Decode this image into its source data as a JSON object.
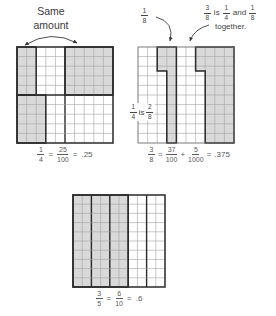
{
  "left_panel": {
    "annotation": {
      "line1": "Same",
      "line2": "amount"
    },
    "caption": {
      "frac1": {
        "num": "1",
        "den": "4"
      },
      "eq1": "=",
      "frac2": {
        "num": "25",
        "den": "100"
      },
      "eq2": "=",
      "decimal": ".25"
    }
  },
  "right_panel": {
    "one_eighth_label": {
      "num": "1",
      "den": "8"
    },
    "note": {
      "frac1": {
        "num": "3",
        "den": "8"
      },
      "word1": "is",
      "frac2": {
        "num": "1",
        "den": "4"
      },
      "word2": "and",
      "frac3": {
        "num": "1",
        "den": "8"
      },
      "line2": "together."
    },
    "inner_label": {
      "frac1": {
        "num": "1",
        "den": "4"
      },
      "word": "is",
      "frac2": {
        "num": "2",
        "den": "8"
      }
    },
    "caption": {
      "frac1": {
        "num": "3",
        "den": "8"
      },
      "eq1": "=",
      "frac2": {
        "num": "37",
        "den": "100"
      },
      "plus": "+",
      "frac3": {
        "num": "5",
        "den": "1000"
      },
      "eq2": "=",
      "decimal": ".375"
    }
  },
  "bottom_panel": {
    "caption": {
      "frac1": {
        "num": "3",
        "den": "5"
      },
      "eq1": "=",
      "frac2": {
        "num": "6",
        "den": "10"
      },
      "eq2": "=",
      "decimal": ".6"
    }
  },
  "colors": {
    "shade": "#d9d9d9",
    "grid_thin": "#a3a3a3",
    "grid_thick": "#2a2a2a",
    "border_thin": "#6e6e6e",
    "arrow": "#3a3a3a"
  },
  "grids": {
    "cells": 10,
    "left": {
      "thick_cols": [
        5
      ],
      "thick_rows": [
        5
      ],
      "outline_regions": true,
      "border_thick": true,
      "shaded_regions": [
        {
          "c0": 0,
          "r0": 0,
          "c1": 2,
          "r1": 5
        },
        {
          "c0": 5,
          "r0": 0,
          "c1": 10,
          "r1": 5
        },
        {
          "c0": 0,
          "r0": 5,
          "c1": 3,
          "r1": 10
        }
      ]
    },
    "right": {
      "thick_cols": [],
      "thick_rows": [],
      "outline_regions": false,
      "border_thick": false,
      "shaded_polygons": [
        [
          [
            2,
            0
          ],
          [
            4,
            0
          ],
          [
            4,
            10
          ],
          [
            3,
            10
          ],
          [
            3,
            2.5
          ],
          [
            2,
            2.5
          ]
        ],
        [
          [
            6,
            0
          ],
          [
            10,
            0
          ],
          [
            10,
            10
          ],
          [
            7,
            10
          ],
          [
            7,
            2.5
          ],
          [
            6,
            2.5
          ]
        ]
      ]
    },
    "bottom": {
      "thick_cols": [
        2,
        4,
        6,
        8
      ],
      "thick_rows": [],
      "outline_regions": true,
      "border_thick": true,
      "shaded_regions": [
        {
          "c0": 0,
          "r0": 0,
          "c1": 6,
          "r1": 10
        }
      ]
    }
  }
}
